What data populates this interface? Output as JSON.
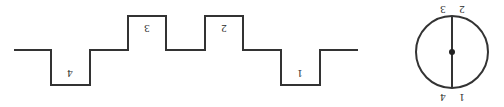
{
  "figure": {
    "name": "square-wave-and-circle-diagram",
    "stroke_color": "#333333",
    "label_color": "#2b2b2b",
    "background_color": "#ffffff",
    "label_orientation": "rotated-180",
    "width": 504,
    "height": 107
  },
  "waveform": {
    "name": "step-square-wave",
    "levels": {
      "top_y": 16,
      "mid_y": 50,
      "bottom_y": 85
    },
    "path": "M 14 50 L 51 50 L 51 85 L 90 85 L 90 50 L 128 50 L 128 16 L 166 16 L 166 50 L 205 50 L 205 16 L 243 16 L 243 50 L 281 50 L 281 85 L 320 85 L 320 50 L 358 50",
    "segments": [
      {
        "level": "mid",
        "x_start": 14,
        "x_end": 51
      },
      {
        "level": "bottom",
        "x_start": 51,
        "x_end": 90
      },
      {
        "level": "mid",
        "x_start": 90,
        "x_end": 128
      },
      {
        "level": "top",
        "x_start": 128,
        "x_end": 166
      },
      {
        "level": "mid",
        "x_start": 166,
        "x_end": 205
      },
      {
        "level": "top",
        "x_start": 205,
        "x_end": 243
      },
      {
        "level": "mid",
        "x_start": 243,
        "x_end": 281
      },
      {
        "level": "bottom",
        "x_start": 281,
        "x_end": 320
      },
      {
        "level": "mid",
        "x_start": 320,
        "x_end": 358
      }
    ],
    "labels": [
      {
        "id": "wave-label-4",
        "text": "4",
        "x": 70,
        "y": 73
      },
      {
        "id": "wave-label-3",
        "text": "3",
        "x": 147,
        "y": 28
      },
      {
        "id": "wave-label-2",
        "text": "2",
        "x": 224,
        "y": 28
      },
      {
        "id": "wave-label-1",
        "text": "1",
        "x": 300,
        "y": 73
      }
    ]
  },
  "circle": {
    "name": "circle-with-vertical-diameter",
    "center_x": 452,
    "center_y": 52,
    "radius": 36,
    "center_dot_radius": 3,
    "diameter": {
      "x": 452,
      "y_top": 16,
      "y_bottom": 88
    },
    "labels": [
      {
        "id": "circle-label-3",
        "text": "3",
        "x": 443,
        "y": 9
      },
      {
        "id": "circle-label-2",
        "text": "2",
        "x": 462,
        "y": 9
      },
      {
        "id": "circle-label-4",
        "text": "4",
        "x": 443,
        "y": 97
      },
      {
        "id": "circle-label-1",
        "text": "1",
        "x": 462,
        "y": 97
      }
    ]
  }
}
